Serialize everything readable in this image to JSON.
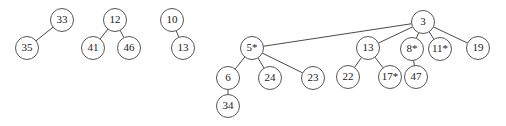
{
  "figure": {
    "kind": "b-tree-forest-diagram",
    "background_color": "#ffffff",
    "node_fill": "#ffffff",
    "node_stroke": "#555555",
    "edge_stroke": "#4a4a4a",
    "label_color": "#1a1a1a",
    "node_radius": 11.5,
    "width": 506,
    "height": 126
  },
  "trees": [
    {
      "name": "tree-1",
      "nodes": [
        {
          "id": "n33",
          "label": "33",
          "x": 62,
          "y": 20
        },
        {
          "id": "n35",
          "label": "35",
          "x": 27,
          "y": 48
        }
      ],
      "edges": [
        {
          "from": "n33",
          "to": "n35"
        }
      ]
    },
    {
      "name": "tree-2",
      "nodes": [
        {
          "id": "n12",
          "label": "12",
          "x": 115,
          "y": 20
        },
        {
          "id": "n41",
          "label": "41",
          "x": 93,
          "y": 48
        },
        {
          "id": "n46",
          "label": "46",
          "x": 129,
          "y": 48
        }
      ],
      "edges": [
        {
          "from": "n12",
          "to": "n41"
        },
        {
          "from": "n12",
          "to": "n46"
        }
      ]
    },
    {
      "name": "tree-3",
      "nodes": [
        {
          "id": "n10",
          "label": "10",
          "x": 172,
          "y": 20
        },
        {
          "id": "n13a",
          "label": "13",
          "x": 183,
          "y": 48
        }
      ],
      "edges": [
        {
          "from": "n10",
          "to": "n13a"
        }
      ]
    },
    {
      "name": "tree-4",
      "nodes": [
        {
          "id": "n3",
          "label": "3",
          "x": 423,
          "y": 22
        },
        {
          "id": "n5s",
          "label": "5*",
          "x": 252,
          "y": 48
        },
        {
          "id": "n13b",
          "label": "13",
          "x": 368,
          "y": 48
        },
        {
          "id": "n8s",
          "label": "8*",
          "x": 412,
          "y": 49
        },
        {
          "id": "n11s",
          "label": "11*",
          "x": 440,
          "y": 49
        },
        {
          "id": "n19",
          "label": "19",
          "x": 478,
          "y": 48
        },
        {
          "id": "n6",
          "label": "6",
          "x": 228,
          "y": 78
        },
        {
          "id": "n24",
          "label": "24",
          "x": 270,
          "y": 78
        },
        {
          "id": "n23",
          "label": "23",
          "x": 313,
          "y": 78
        },
        {
          "id": "n22",
          "label": "22",
          "x": 348,
          "y": 77
        },
        {
          "id": "n17s",
          "label": "17*",
          "x": 390,
          "y": 77
        },
        {
          "id": "n47",
          "label": "47",
          "x": 416,
          "y": 77
        },
        {
          "id": "n34",
          "label": "34",
          "x": 228,
          "y": 106
        }
      ],
      "edges": [
        {
          "from": "n3",
          "to": "n5s"
        },
        {
          "from": "n3",
          "to": "n13b"
        },
        {
          "from": "n3",
          "to": "n8s"
        },
        {
          "from": "n3",
          "to": "n11s"
        },
        {
          "from": "n3",
          "to": "n19"
        },
        {
          "from": "n5s",
          "to": "n6"
        },
        {
          "from": "n5s",
          "to": "n24"
        },
        {
          "from": "n5s",
          "to": "n23"
        },
        {
          "from": "n13b",
          "to": "n22"
        },
        {
          "from": "n13b",
          "to": "n17s"
        },
        {
          "from": "n8s",
          "to": "n47"
        },
        {
          "from": "n6",
          "to": "n34"
        }
      ]
    }
  ]
}
